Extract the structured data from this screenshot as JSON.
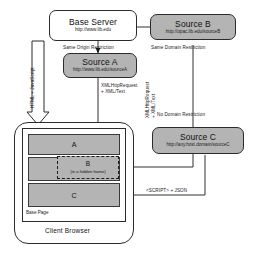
{
  "diagram": {
    "nodes": {
      "base_server": {
        "label": "Base Server",
        "url": "http://www.lib.edu"
      },
      "source_a": {
        "label": "Source A",
        "url": "http://www.lib.edu/sourceA"
      },
      "source_b": {
        "label": "Source B",
        "url": "http://opac.lib.edu/sourceB"
      },
      "source_c": {
        "label": "Source C",
        "url": "http://any.host.domain/sourceC"
      }
    },
    "restrictions": {
      "same_origin": "Same Origin Restriction",
      "same_domain": "Same Domain Restriction",
      "no_domain": "No Domain Restriction"
    },
    "transports": {
      "html_js": "HTML + JavaScript",
      "xhr_a": "XMLHttpRequest\n+ XML/Text",
      "xhr_a_line1": "XMLHttpRequest",
      "xhr_a_line2": "+ XML/Text",
      "xhr_b_line1": "XMLHttpRequest",
      "xhr_b_line2": "+ XML/Text",
      "script_json": "<SCRIPT> + JSON"
    },
    "browser": {
      "title": "Client Browser",
      "base_page_label": "Base Page",
      "panels": [
        {
          "id": "A",
          "label": "A"
        },
        {
          "id": "B",
          "label": "B",
          "sub": "(in a hidden frame)"
        },
        {
          "id": "C",
          "label": "C"
        }
      ]
    },
    "colors": {
      "node_fill_grey": "#b4b4b4",
      "node_fill_white": "#ffffff",
      "stroke": "#2b2b2b",
      "arrow_fill": "#ffffff"
    }
  }
}
